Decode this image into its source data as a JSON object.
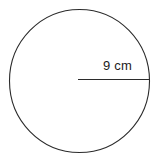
{
  "figure": {
    "name": "circle-with-radius-diagram",
    "background_color": "#ffffff",
    "stroke_color": "#2b2b2b",
    "text_color": "#1c1c1c",
    "circle": {
      "name": "circle-outline",
      "center_x": 79.5,
      "center_y": 81,
      "radius_x": 70,
      "radius_y": 71.5,
      "stroke_width": 1.1,
      "fill": "none"
    },
    "radius_segment": {
      "name": "radius-line",
      "x1": 78,
      "y1": 79.5,
      "x2": 150,
      "y2": 79.5,
      "stroke_width": 1.2
    },
    "radius_label": {
      "text": "9 cm",
      "value": 9,
      "unit": "cm"
    }
  }
}
